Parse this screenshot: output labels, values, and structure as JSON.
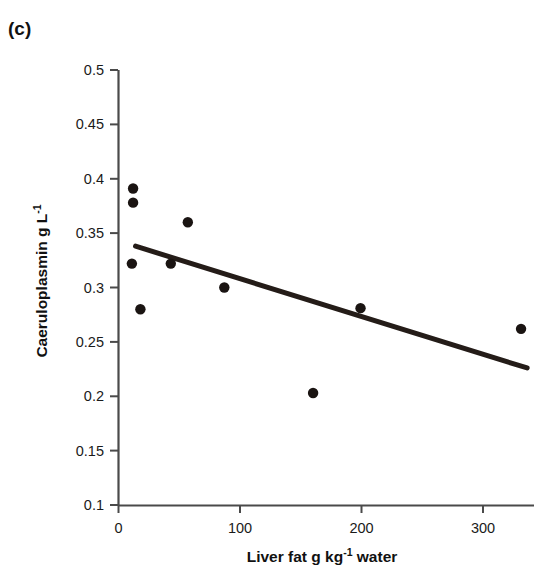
{
  "panel": {
    "label": "(c)"
  },
  "axes": {
    "y_title_main": "Caeruloplasmin g L",
    "y_title_sup": "-1",
    "x_title_main_a": "Liver fat g kg",
    "x_title_sup": "-1",
    "x_title_main_b": " water",
    "y_ticks": [
      "0.5",
      "0.45",
      "0.4",
      "0.35",
      "0.3",
      "0.25",
      "0.2",
      "0.15",
      "0.1"
    ],
    "x_ticks": [
      "0",
      "100",
      "200",
      "300"
    ]
  },
  "colors": {
    "marker": "#1a1412",
    "line": "#241c18",
    "axis": "#4a4a4a",
    "text": "#111111",
    "background": "#ffffff"
  },
  "chart_data": {
    "type": "scatter",
    "title": "(c)",
    "xlabel": "Liver fat g kg-1 water",
    "ylabel": "Caeruloplasmin g L-1",
    "xlim": [
      0,
      340
    ],
    "ylim": [
      0.1,
      0.5
    ],
    "xticks": [
      0,
      100,
      200,
      300
    ],
    "yticks": [
      0.1,
      0.15,
      0.2,
      0.25,
      0.3,
      0.35,
      0.4,
      0.45,
      0.5
    ],
    "grid": false,
    "legend": null,
    "points": [
      {
        "x": 12,
        "y": 0.391
      },
      {
        "x": 12,
        "y": 0.378
      },
      {
        "x": 11,
        "y": 0.322
      },
      {
        "x": 18,
        "y": 0.28
      },
      {
        "x": 43,
        "y": 0.322
      },
      {
        "x": 57,
        "y": 0.36
      },
      {
        "x": 87,
        "y": 0.3
      },
      {
        "x": 160,
        "y": 0.203
      },
      {
        "x": 199,
        "y": 0.281
      },
      {
        "x": 331,
        "y": 0.262
      }
    ],
    "series": [
      {
        "name": "Caeruloplasmin vs liver fat",
        "type": "scatter",
        "values": [
          0.391,
          0.378,
          0.322,
          0.28,
          0.322,
          0.36,
          0.3,
          0.203,
          0.281,
          0.262
        ],
        "x": [
          12,
          12,
          11,
          18,
          43,
          57,
          87,
          160,
          199,
          331
        ]
      },
      {
        "name": "regression line",
        "type": "line",
        "x": [
          14,
          336
        ],
        "values": [
          0.338,
          0.226
        ]
      }
    ],
    "trendline": {
      "x_start": 14,
      "y_start": 0.338,
      "x_end": 336,
      "y_end": 0.226,
      "slope": -0.000348,
      "intercept": 0.343
    }
  }
}
